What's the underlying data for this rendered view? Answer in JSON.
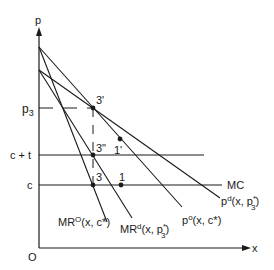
{
  "diagram": {
    "type": "economics-price-quantity",
    "axes": {
      "y_label": "p",
      "x_label": "x",
      "origin_label": "O"
    },
    "y_ticks": [
      {
        "label": "p",
        "sub": "3",
        "y": 108
      },
      {
        "label": "c + t",
        "y": 155
      },
      {
        "label": "c",
        "y": 185
      }
    ],
    "horizontal_lines": [
      {
        "name": "c-plus-t-line",
        "y": 155,
        "x_end": 204
      },
      {
        "name": "mc-line",
        "y": 185,
        "x_end": 222,
        "label": "MC"
      }
    ],
    "curves": [
      {
        "name": "demand-pd",
        "label_main": "p",
        "label_sup": "d",
        "label_args": "(x, p",
        "label_args_sub": "3",
        "label_args_sup": "*",
        "label_close": ")"
      },
      {
        "name": "demand-po",
        "label_main": "p",
        "label_sup": "o",
        "label_args": "(x, c*)"
      },
      {
        "name": "mr-d",
        "label_main": "MR",
        "label_sup": "d",
        "label_args": "(x, p",
        "label_args_sub": "3",
        "label_args_sup": "*",
        "label_close": ")"
      },
      {
        "name": "mr-o",
        "label_main": "MR",
        "label_sup": "O",
        "label_args": "(x, c*)"
      }
    ],
    "points": [
      {
        "label": "3'",
        "x": 93,
        "y": 108
      },
      {
        "label": "3\"",
        "x": 93,
        "y": 155
      },
      {
        "label": "3",
        "x": 93,
        "y": 185
      },
      {
        "label": "1",
        "x": 121,
        "y": 185
      },
      {
        "label": "1'",
        "x": 120,
        "y": 139
      }
    ],
    "colors": {
      "ink": "#1a1a1a",
      "background": "#ffffff"
    }
  }
}
